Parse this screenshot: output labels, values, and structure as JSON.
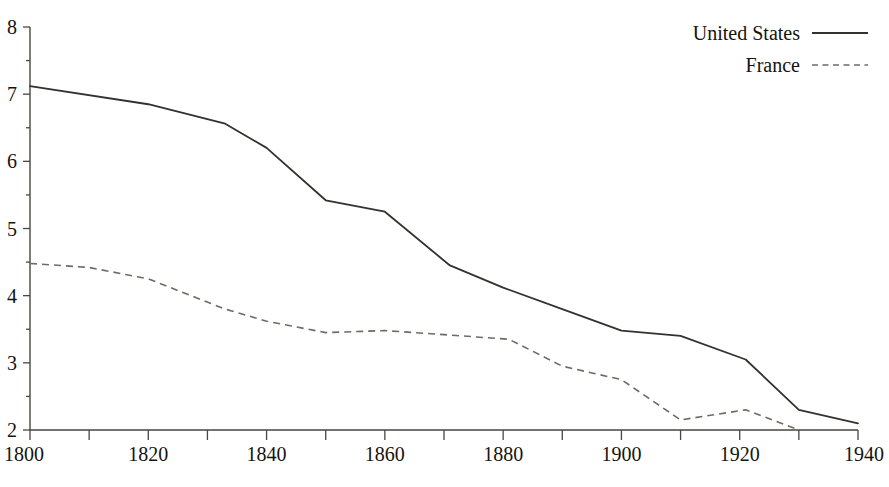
{
  "chart_data": {
    "type": "line",
    "title": "",
    "subtitle": "",
    "xlabel": "",
    "ylabel": "",
    "xlim": [
      1800,
      1940
    ],
    "ylim": [
      2,
      8
    ],
    "grid": false,
    "legend_position": "top-right",
    "x_ticks": [
      1800,
      1820,
      1840,
      1860,
      1880,
      1900,
      1920,
      1940
    ],
    "x_tick_labels": [
      "1800",
      "1820",
      "1840",
      "1860",
      "1880",
      "1900",
      "1920",
      "1940"
    ],
    "x_minor_ticks": [
      1810,
      1830,
      1850,
      1870,
      1890,
      1910,
      1930
    ],
    "y_ticks": [
      2,
      3,
      4,
      5,
      6,
      7,
      8
    ],
    "y_tick_labels": [
      "2",
      "3",
      "4",
      "5",
      "6",
      "7",
      "8"
    ],
    "y_minor_ticks": [
      2.5,
      3.5,
      4.5,
      5.5,
      6.5,
      7.5
    ],
    "series": [
      {
        "name": "United States",
        "style": "solid",
        "color": "#35312c",
        "x": [
          1800,
          1820,
          1833,
          1840,
          1850,
          1860,
          1871,
          1880,
          1890,
          1900,
          1910,
          1921,
          1930,
          1940
        ],
        "values": [
          7.12,
          6.85,
          6.56,
          6.2,
          5.42,
          5.25,
          4.45,
          4.12,
          3.8,
          3.48,
          3.4,
          3.05,
          2.3,
          2.1
        ]
      },
      {
        "name": "France",
        "style": "dashed",
        "color": "#6f6b66",
        "x": [
          1800,
          1810,
          1820,
          1833,
          1840,
          1850,
          1860,
          1870,
          1881,
          1890,
          1900,
          1910,
          1921,
          1930
        ],
        "values": [
          4.48,
          4.42,
          4.25,
          3.8,
          3.62,
          3.45,
          3.48,
          3.42,
          3.35,
          2.95,
          2.75,
          2.15,
          2.3,
          2.0
        ]
      }
    ]
  },
  "legend": {
    "entries": [
      {
        "label": "United States",
        "style": "solid"
      },
      {
        "label": "France",
        "style": "dashed"
      }
    ]
  },
  "page": {
    "cropped_header_text": ""
  }
}
